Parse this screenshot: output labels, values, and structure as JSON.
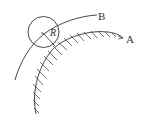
{
  "diagram": {
    "labels": {
      "curve_a": "A",
      "curve_b": "B",
      "radius": "R"
    },
    "colors": {
      "stroke": "#333333",
      "background": "#ffffff"
    },
    "elements": [
      {
        "id": "surface-a",
        "description": "hatched boundary surface curve A"
      },
      {
        "id": "path-b",
        "description": "trajectory curve B"
      },
      {
        "id": "circle",
        "description": "circle of radius R touching surface A"
      }
    ]
  }
}
